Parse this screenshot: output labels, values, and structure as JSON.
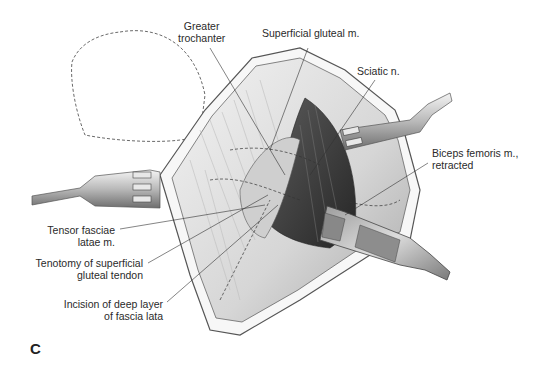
{
  "figure": {
    "panel_letter": "C",
    "labels": {
      "greater_trochanter": [
        "Greater",
        "trochanter"
      ],
      "superficial_gluteal": [
        "Superficial gluteal m."
      ],
      "sciatic": [
        "Sciatic n."
      ],
      "biceps_femoris": [
        "Biceps femoris m.,",
        "retracted"
      ],
      "tensor_fasciae": [
        "Tensor fasciae",
        "latae m."
      ],
      "tenotomy": [
        "Tenotomy of superficial",
        "gluteal tendon"
      ],
      "incision": [
        "Incision of deep layer",
        "of fascia lata"
      ]
    },
    "colors": {
      "background": "#ffffff",
      "ink": "#2a2a2a",
      "tissue_light": "#ececec",
      "tissue_mid": "#b5b5b5",
      "tissue_dark": "#3d3d3d",
      "metal": "#c8c8c8"
    }
  }
}
